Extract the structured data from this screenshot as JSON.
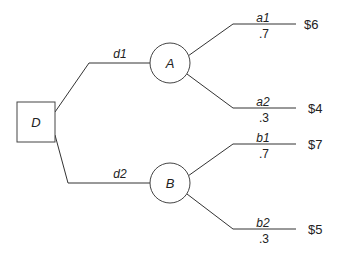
{
  "diagram": {
    "type": "decision-tree",
    "decision_node": {
      "label": "D"
    },
    "decisions": [
      {
        "label": "d1",
        "chance_node": "A"
      },
      {
        "label": "d2",
        "chance_node": "B"
      }
    ],
    "chance_nodes": [
      {
        "label": "A",
        "outcomes": [
          {
            "label": "a1",
            "probability": ".7",
            "payoff": "$6"
          },
          {
            "label": "a2",
            "probability": ".3",
            "payoff": "$4"
          }
        ]
      },
      {
        "label": "B",
        "outcomes": [
          {
            "label": "b1",
            "probability": ".7",
            "payoff": "$7"
          },
          {
            "label": "b2",
            "probability": ".3",
            "payoff": "$5"
          }
        ]
      }
    ]
  }
}
